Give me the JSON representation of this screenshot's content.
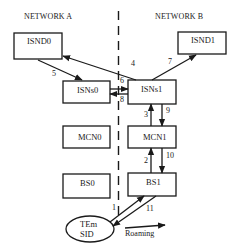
{
  "diagram": {
    "networks": [
      {
        "id": "A",
        "label": "NETWORK A"
      },
      {
        "id": "B",
        "label": "NETWORK B"
      }
    ],
    "nodes": [
      {
        "id": "ISND0",
        "label": "ISND0",
        "network": "A"
      },
      {
        "id": "ISND1",
        "label": "ISND1",
        "network": "B"
      },
      {
        "id": "ISNs0",
        "label": "ISNs0",
        "network": "A"
      },
      {
        "id": "ISNs1",
        "label": "ISNs1",
        "network": "B"
      },
      {
        "id": "MCN0",
        "label": "MCN0",
        "network": "A"
      },
      {
        "id": "MCN1",
        "label": "MCN1",
        "network": "B"
      },
      {
        "id": "BS0",
        "label": "BS0",
        "network": "A"
      },
      {
        "id": "BS1",
        "label": "BS1",
        "network": "B"
      },
      {
        "id": "TEm",
        "label_line1": "TEm",
        "label_line2": "SID",
        "shape": "ellipse"
      }
    ],
    "edges": [
      {
        "label": "1",
        "from": "TEm",
        "to": "BS1"
      },
      {
        "label": "2",
        "from": "BS1",
        "to": "MCN1"
      },
      {
        "label": "3",
        "from": "MCN1",
        "to": "ISNs1"
      },
      {
        "label": "4",
        "from": "ISNs1",
        "to": "ISND0"
      },
      {
        "label": "5",
        "from": "ISND0",
        "to": "ISNs0"
      },
      {
        "label": "6",
        "from": "ISNs0",
        "to": "ISNs1"
      },
      {
        "label": "7",
        "from": "ISNs1",
        "to": "ISND1"
      },
      {
        "label": "8",
        "from": "ISNs1",
        "to": "ISNs0"
      },
      {
        "label": "9",
        "from": "ISNs1",
        "to": "MCN1"
      },
      {
        "label": "10",
        "from": "MCN1",
        "to": "BS1"
      },
      {
        "label": "11",
        "from": "BS1",
        "to": "TEm"
      }
    ],
    "roaming_label": "Roaming"
  }
}
